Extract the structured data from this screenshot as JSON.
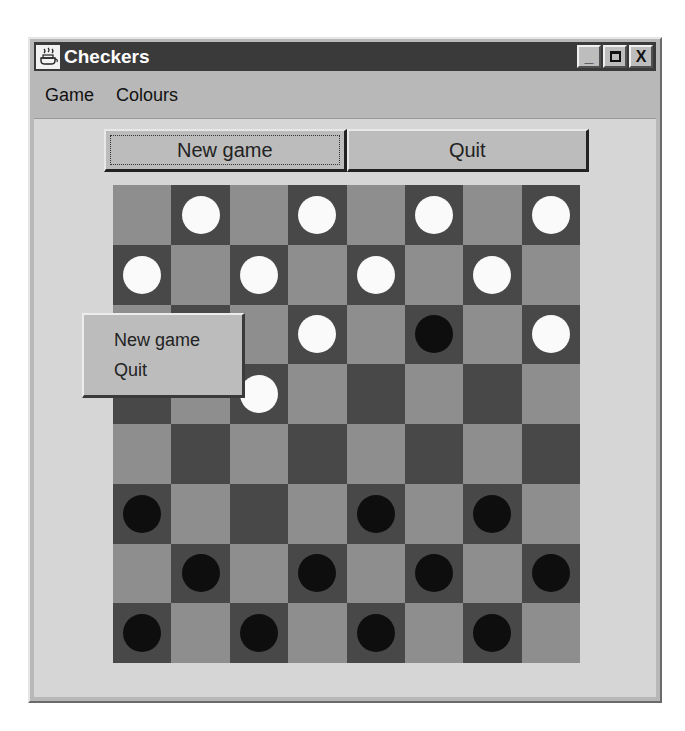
{
  "window": {
    "title": "Checkers",
    "icon": "java-coffee-cup-icon",
    "controls": {
      "minimize": "_",
      "maximize": "□",
      "close": "X"
    }
  },
  "menubar": {
    "items": [
      {
        "label": "Game"
      },
      {
        "label": "Colours"
      }
    ]
  },
  "toolbar": {
    "new_game_label": "New game",
    "quit_label": "Quit"
  },
  "popup_menu": {
    "items": [
      {
        "label": "New game"
      },
      {
        "label": "Quit"
      }
    ]
  },
  "colors": {
    "light_square": "#8e8e8e",
    "dark_square": "#484848",
    "white_piece": "#fafafa",
    "black_piece": "#0e0e0e",
    "title_bar": "#3a3a3a"
  },
  "board": {
    "size": 8,
    "first_square": "light",
    "rows": [
      [
        "",
        "W",
        "",
        "W",
        "",
        "W",
        "",
        "W"
      ],
      [
        "W",
        "",
        "W",
        "",
        "W",
        "",
        "W",
        ""
      ],
      [
        "",
        "",
        "",
        "W",
        "",
        "B",
        "",
        "W"
      ],
      [
        "",
        "",
        "W",
        "",
        "",
        "",
        "",
        ""
      ],
      [
        "",
        "",
        "",
        "",
        "",
        "",
        "",
        ""
      ],
      [
        "B",
        "",
        "",
        "",
        "B",
        "",
        "B",
        ""
      ],
      [
        "",
        "B",
        "",
        "B",
        "",
        "B",
        "",
        "B"
      ],
      [
        "B",
        "",
        "B",
        "",
        "B",
        "",
        "B",
        ""
      ]
    ]
  }
}
